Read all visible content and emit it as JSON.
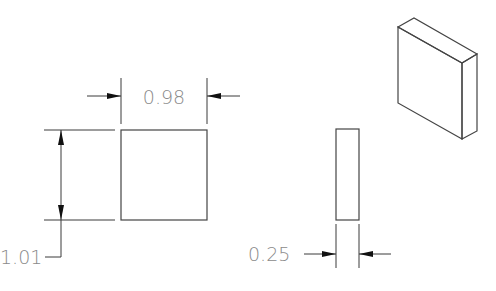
{
  "drawing": {
    "front_view": {
      "width_dimension": "0.98",
      "height_dimension": "1.01"
    },
    "side_view": {
      "thickness_dimension": "0.25"
    },
    "isometric_view": {
      "label": ""
    }
  },
  "colors": {
    "line": "#3a3a3a",
    "dimension_text": "#8a8a8a",
    "arrow": "#111111",
    "background": "#ffffff"
  }
}
